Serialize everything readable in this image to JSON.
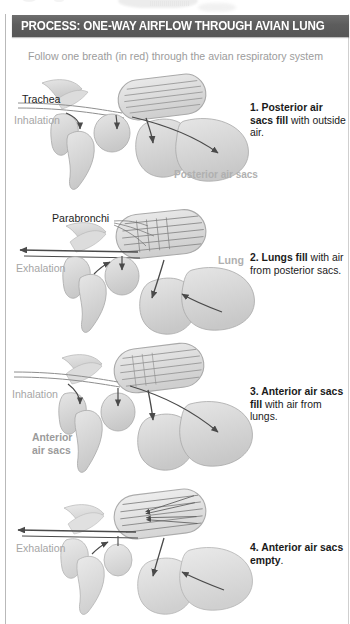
{
  "header": {
    "title": "PROCESS: ONE-WAY AIRFLOW THROUGH AVIAN LUNG",
    "bar_color": "#5c5c5c",
    "text_color": "#ffffff"
  },
  "subtitle": "Follow one breath (in red) through the avian respiratory system",
  "subtitle_color": "#9c9c9c",
  "panels": [
    {
      "number": "1.",
      "caption_bold": "1. Posterior air sacs fill",
      "caption_rest": " with outside air.",
      "labels": {
        "trachea": "Trachea",
        "breath_phase": "Inhalation",
        "sac": "Posterior air sacs"
      }
    },
    {
      "number": "2.",
      "caption_bold": "2. Lungs fill",
      "caption_rest": " with air from posterior sacs.",
      "labels": {
        "parabronchi": "Parabronchi",
        "breath_phase": "Exhalation",
        "lung": "Lung"
      }
    },
    {
      "number": "3.",
      "caption_bold": "3. Anterior air sacs fill",
      "caption_rest": " with air from lungs.",
      "labels": {
        "breath_phase": "Inhalation",
        "sac": "Anterior air sacs"
      }
    },
    {
      "number": "4.",
      "caption_bold": "4. Anterior air sacs empty",
      "caption_rest": ".",
      "labels": {
        "breath_phase": "Exhalation"
      }
    }
  ],
  "colors": {
    "tissue_fill": "#d8d8d8",
    "tissue_stroke": "#a8a8a8",
    "lung_fill": "#dcdcdc",
    "arrow": "#4a4a4a",
    "label_gray": "#a6a6a6",
    "frame": "#b9b9b9"
  }
}
